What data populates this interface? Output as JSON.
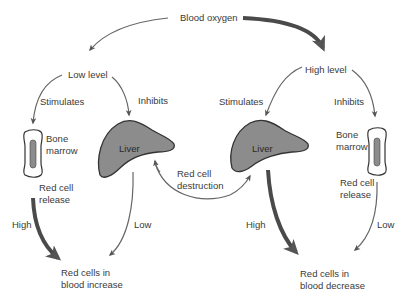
{
  "diagram": {
    "top": {
      "label": "Blood oxygen"
    },
    "left": {
      "level": "Low level",
      "stimulates": "Stimulates",
      "inhibits": "Inhibits",
      "bone_marrow_line1": "Bone",
      "bone_marrow_line2": "marrow",
      "liver": "Liver",
      "release_line1": "Red cell",
      "release_line2": "release",
      "high": "High",
      "low": "Low",
      "result_line1": "Red cells in",
      "result_line2": "blood increase"
    },
    "center": {
      "destruction_line1": "Red cell",
      "destruction_line2": "destruction"
    },
    "right": {
      "level": "High level",
      "stimulates": "Stimulates",
      "inhibits": "Inhibits",
      "bone_marrow_line1": "Bone",
      "bone_marrow_line2": "marrow",
      "liver": "Liver",
      "release_line1": "Red cell",
      "release_line2": "release",
      "high": "High",
      "low": "Low",
      "result_line1": "Red cells in",
      "result_line2": "blood decrease"
    },
    "colors": {
      "arrow": "#555555",
      "liver_fill": "#8c8c8c",
      "marrow_fill": "#8c8c8c",
      "text": "#3a3a3a"
    }
  }
}
